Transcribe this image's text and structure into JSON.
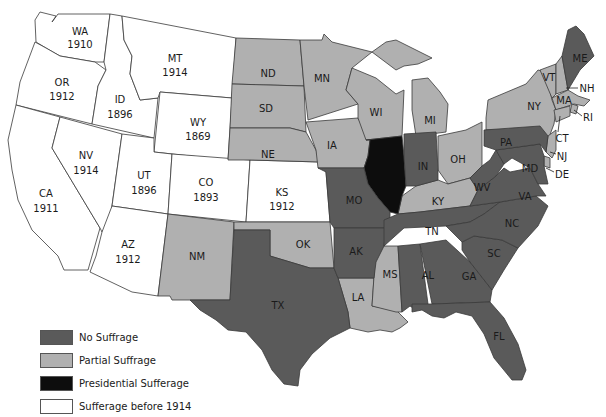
{
  "colors": {
    "no_suffrage": "#5a5a5a",
    "partial": "#b0b0b0",
    "presidential": "#0d0d0d",
    "before_1914": "#ffffff"
  },
  "legend": [
    {
      "key": "no_suffrage",
      "label": "No Suffrage",
      "color": "#5a5a5a"
    },
    {
      "key": "partial",
      "label": "Partial Suffrage",
      "color": "#b0b0b0"
    },
    {
      "key": "presidential",
      "label": "Presidential Sufferage",
      "color": "#0d0d0d"
    },
    {
      "key": "before_1914",
      "label": "Sufferage before 1914",
      "color": "#ffffff"
    }
  ],
  "states": {
    "WA": {
      "abbr": "WA",
      "year": "1910",
      "status": "before_1914"
    },
    "OR": {
      "abbr": "OR",
      "year": "1912",
      "status": "before_1914"
    },
    "CA": {
      "abbr": "CA",
      "year": "1911",
      "status": "before_1914"
    },
    "ID": {
      "abbr": "ID",
      "year": "1896",
      "status": "before_1914"
    },
    "NV": {
      "abbr": "NV",
      "year": "1914",
      "status": "before_1914"
    },
    "MT": {
      "abbr": "MT",
      "year": "1914",
      "status": "before_1914"
    },
    "WY": {
      "abbr": "WY",
      "year": "1869",
      "status": "before_1914"
    },
    "UT": {
      "abbr": "UT",
      "year": "1896",
      "status": "before_1914"
    },
    "CO": {
      "abbr": "CO",
      "year": "1893",
      "status": "before_1914"
    },
    "AZ": {
      "abbr": "AZ",
      "year": "1912",
      "status": "before_1914"
    },
    "KS": {
      "abbr": "KS",
      "year": "1912",
      "status": "before_1914"
    },
    "NM": {
      "abbr": "NM",
      "status": "partial"
    },
    "ND": {
      "abbr": "ND",
      "status": "partial"
    },
    "SD": {
      "abbr": "SD",
      "status": "partial"
    },
    "NE": {
      "abbr": "NE",
      "status": "partial"
    },
    "MN": {
      "abbr": "MN",
      "status": "partial"
    },
    "IA": {
      "abbr": "IA",
      "status": "partial"
    },
    "WI": {
      "abbr": "WI",
      "status": "partial"
    },
    "MI": {
      "abbr": "MI",
      "status": "partial"
    },
    "OH": {
      "abbr": "OH",
      "status": "partial"
    },
    "KY": {
      "abbr": "KY",
      "status": "partial"
    },
    "OK": {
      "abbr": "OK",
      "status": "partial"
    },
    "LA": {
      "abbr": "LA",
      "status": "partial"
    },
    "MS": {
      "abbr": "MS",
      "status": "partial"
    },
    "NY": {
      "abbr": "NY",
      "status": "partial"
    },
    "VT": {
      "abbr": "VT",
      "status": "partial"
    },
    "NH": {
      "abbr": "NH",
      "status": "partial"
    },
    "MA": {
      "abbr": "MA",
      "status": "partial"
    },
    "RI": {
      "abbr": "RI",
      "status": "partial"
    },
    "CT": {
      "abbr": "CT",
      "status": "partial"
    },
    "NJ": {
      "abbr": "NJ",
      "status": "partial"
    },
    "DE": {
      "abbr": "DE",
      "status": "partial"
    },
    "IL": {
      "abbr": "",
      "status": "presidential"
    },
    "TX": {
      "abbr": "TX",
      "status": "no_suffrage"
    },
    "MO": {
      "abbr": "MO",
      "status": "no_suffrage"
    },
    "AK": {
      "abbr": "AK",
      "status": "no_suffrage"
    },
    "IN": {
      "abbr": "IN",
      "status": "no_suffrage"
    },
    "TN": {
      "abbr": "TN",
      "status": "no_suffrage"
    },
    "AL": {
      "abbr": "AL",
      "status": "no_suffrage"
    },
    "GA": {
      "abbr": "GA",
      "status": "no_suffrage"
    },
    "FL": {
      "abbr": "FL",
      "status": "no_suffrage"
    },
    "SC": {
      "abbr": "SC",
      "status": "no_suffrage"
    },
    "NC": {
      "abbr": "NC",
      "status": "no_suffrage"
    },
    "VA": {
      "abbr": "VA",
      "status": "no_suffrage"
    },
    "WV": {
      "abbr": "WV",
      "status": "no_suffrage"
    },
    "MD": {
      "abbr": "MD",
      "status": "no_suffrage"
    },
    "PA": {
      "abbr": "PA",
      "status": "no_suffrage"
    },
    "ME": {
      "abbr": "ME",
      "status": "no_suffrage"
    }
  }
}
